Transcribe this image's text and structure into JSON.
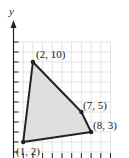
{
  "chart_data": {
    "type": "scatter",
    "subtype": "polygon",
    "title": "",
    "xlabel": "",
    "ylabel": "y",
    "xlim": [
      0,
      10
    ],
    "ylim": [
      0,
      12
    ],
    "grid": true,
    "legend": null,
    "points": [
      {
        "x": 1,
        "y": 2,
        "label": "(1, 2)"
      },
      {
        "x": 2,
        "y": 10,
        "label": "(2, 10)"
      },
      {
        "x": 7,
        "y": 5,
        "label": "(7, 5)"
      },
      {
        "x": 8,
        "y": 3,
        "label": "(8, 3)"
      }
    ],
    "polygon_order": [
      "(1, 2)",
      "(2, 10)",
      "(7, 5)",
      "(8, 3)"
    ],
    "fill_color": "#d9d9d9",
    "edge_color": "#222222",
    "grid_color": "#dcdcdc"
  },
  "labels": {
    "y_axis": "y",
    "p1": "(1, 2)",
    "p2": "(2, 10)",
    "p3": "(7, 5)",
    "p4": "(8, 3)"
  }
}
